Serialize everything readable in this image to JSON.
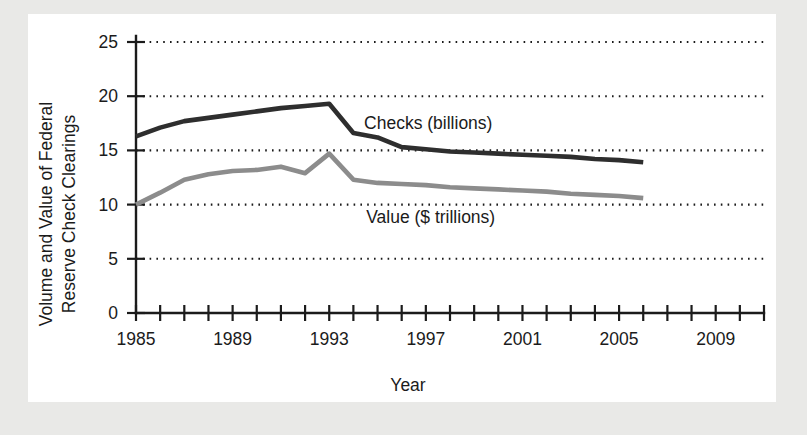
{
  "figure": {
    "background_color": "#e9e9e7",
    "panel_color": "#ffffff"
  },
  "chart_data": {
    "type": "line",
    "title": "",
    "xlabel": "Year",
    "ylabel": "Volume and Value of Federal Reserve Check Clearings",
    "ylabel_line1": "Volume and Value of Federal",
    "ylabel_line2": "Reserve Check Clearings",
    "xlim": [
      1985,
      2011
    ],
    "ylim": [
      0,
      25
    ],
    "yticks": [
      0,
      5,
      10,
      15,
      20,
      25
    ],
    "ytick_labels": [
      "0",
      "5",
      "10",
      "15",
      "20",
      "25"
    ],
    "xticks": [
      1985,
      1986,
      1987,
      1988,
      1989,
      1990,
      1991,
      1992,
      1993,
      1994,
      1995,
      1996,
      1997,
      1998,
      1999,
      2000,
      2001,
      2002,
      2003,
      2004,
      2005,
      2006,
      2007,
      2008,
      2009,
      2010,
      2011
    ],
    "xtick_labels_shown": [
      "1985",
      "1989",
      "1993",
      "1997",
      "2001",
      "2005",
      "2009"
    ],
    "xtick_label_years": [
      1985,
      1989,
      1993,
      1997,
      2001,
      2005,
      2009
    ],
    "grid": true,
    "grid_axis": "y",
    "grid_style": "dotted",
    "legend_position": "inline-annotations",
    "series": [
      {
        "name": "Checks (billions)",
        "color": "#2e2e2e",
        "line_width": 4.6,
        "label_x": 1997.1,
        "label_y": 17.0,
        "x": [
          1985,
          1986,
          1987,
          1988,
          1989,
          1990,
          1991,
          1992,
          1993,
          1994,
          1995,
          1996,
          1997,
          1998,
          1999,
          2000,
          2001,
          2002,
          2003,
          2004,
          2005,
          2006
        ],
        "values": [
          16.3,
          17.1,
          17.7,
          18.0,
          18.3,
          18.6,
          18.9,
          19.1,
          19.3,
          16.6,
          16.2,
          15.3,
          15.1,
          14.9,
          14.8,
          14.7,
          14.6,
          14.5,
          14.4,
          14.2,
          14.1,
          13.9
        ]
      },
      {
        "name": "Value ($ trillions)",
        "color": "#8c8c8c",
        "line_width": 4.6,
        "label_x": 1997.2,
        "label_y": 8.3,
        "x": [
          1985,
          1986,
          1987,
          1988,
          1989,
          1990,
          1991,
          1992,
          1993,
          1994,
          1995,
          1996,
          1997,
          1998,
          1999,
          2000,
          2001,
          2002,
          2003,
          2004,
          2005,
          2006
        ],
        "values": [
          10.0,
          11.1,
          12.3,
          12.8,
          13.1,
          13.2,
          13.5,
          12.9,
          14.7,
          12.3,
          12.0,
          11.9,
          11.8,
          11.6,
          11.5,
          11.4,
          11.3,
          11.2,
          11.0,
          10.9,
          10.8,
          10.6
        ]
      }
    ]
  }
}
